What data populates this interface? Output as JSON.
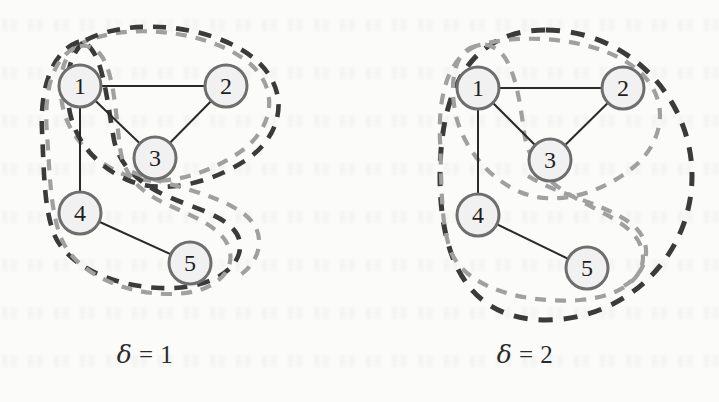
{
  "figure": {
    "background_color": "#fbfbfa",
    "node_fill": "#f1f1f1",
    "node_stroke": "#6e6e6e",
    "edge_color": "#2a2a2a",
    "dark_dash_color": "#3b3b3b",
    "light_dash_color": "#a0a0a0"
  },
  "panels": [
    {
      "id": "left",
      "caption_symbol": "δ",
      "caption_relation": " = ",
      "caption_value": "1",
      "caption_text": "δ = 1",
      "nodes": [
        {
          "label": "1",
          "x": 80,
          "y": 86
        },
        {
          "label": "2",
          "x": 226,
          "y": 86
        },
        {
          "label": "3",
          "x": 155,
          "y": 158
        },
        {
          "label": "4",
          "x": 80,
          "y": 213
        },
        {
          "label": "5",
          "x": 190,
          "y": 263
        }
      ],
      "edges": [
        {
          "from": "1",
          "to": "2"
        },
        {
          "from": "1",
          "to": "3"
        },
        {
          "from": "2",
          "to": "3"
        },
        {
          "from": "1",
          "to": "4"
        },
        {
          "from": "4",
          "to": "5"
        }
      ],
      "regions": [
        {
          "name": "dark-region-upper",
          "color": "#3b3b3b",
          "covers": [
            "1",
            "2",
            "3"
          ]
        },
        {
          "name": "light-region-upper",
          "color": "#a0a0a0",
          "covers": [
            "1",
            "2",
            "3"
          ]
        },
        {
          "name": "dark-region-lower",
          "color": "#3b3b3b",
          "covers": [
            "1",
            "4",
            "5"
          ]
        },
        {
          "name": "light-region-lower",
          "color": "#a0a0a0",
          "covers": [
            "4",
            "5",
            "3"
          ]
        }
      ]
    },
    {
      "id": "right",
      "caption_symbol": "δ",
      "caption_relation": " = ",
      "caption_value": "2",
      "caption_text": "δ = 2",
      "nodes": [
        {
          "label": "1",
          "x": 478,
          "y": 88
        },
        {
          "label": "2",
          "x": 623,
          "y": 88
        },
        {
          "label": "3",
          "x": 550,
          "y": 160
        },
        {
          "label": "4",
          "x": 478,
          "y": 215
        },
        {
          "label": "5",
          "x": 587,
          "y": 268
        }
      ],
      "edges": [
        {
          "from": "1",
          "to": "2"
        },
        {
          "from": "1",
          "to": "3"
        },
        {
          "from": "2",
          "to": "3"
        },
        {
          "from": "1",
          "to": "4"
        },
        {
          "from": "4",
          "to": "5"
        }
      ],
      "regions": [
        {
          "name": "dark-region-outer",
          "color": "#3b3b3b",
          "covers": [
            "1",
            "2",
            "3",
            "4",
            "5"
          ]
        },
        {
          "name": "light-region-upper",
          "color": "#a0a0a0",
          "covers": [
            "1",
            "2",
            "3"
          ]
        },
        {
          "name": "light-region-lower",
          "color": "#a0a0a0",
          "covers": [
            "1",
            "3",
            "4",
            "5"
          ]
        }
      ]
    }
  ]
}
